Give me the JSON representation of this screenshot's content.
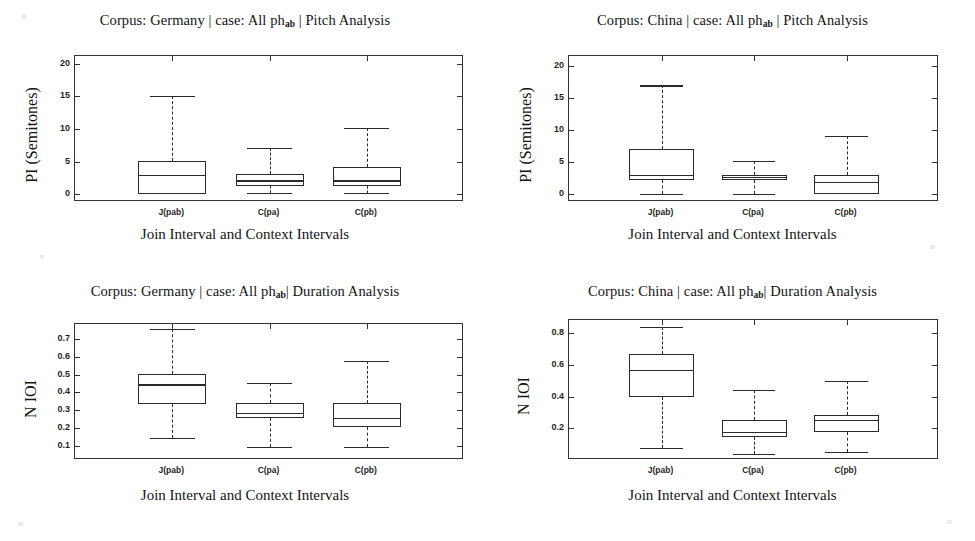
{
  "figure": {
    "background": "#ffffff",
    "line_color": "#2b2b2b",
    "axis_color": "#333333"
  },
  "common": {
    "xlabel": "Join Interval and Context Intervals",
    "categories": [
      "J(pab)",
      "C(pa)",
      "C(pb)"
    ],
    "title_prefix": "Corpus: ",
    "title_case": " | case: All ph",
    "title_sub": "ab"
  },
  "panels": [
    {
      "id": "germany-pitch",
      "title_corpus": "Germany",
      "title_analysis": " | Pitch Analysis",
      "title_full": "Corpus: Germany | case: All phab | Pitch Analysis",
      "ylabel": "PI (Semitones)",
      "xlabel": "Join Interval and Context Intervals",
      "yticks": [
        "0",
        "5",
        "10",
        "15",
        "20"
      ],
      "ytick_values": [
        0,
        5,
        10,
        15,
        20
      ],
      "ylim": [
        -1.2,
        21.2
      ],
      "xtick_labels": [
        "J(pab)",
        "C(pa)",
        "C(pb)"
      ]
    },
    {
      "id": "china-pitch",
      "title_corpus": "China",
      "title_analysis": " | Pitch Analysis",
      "title_full": "Corpus: China | case: All phab | Pitch Analysis",
      "ylabel": "PI (Semitones)",
      "xlabel": "Join Interval and Context Intervals",
      "yticks": [
        "0",
        "5",
        "10",
        "15",
        "20"
      ],
      "ytick_values": [
        0,
        5,
        10,
        15,
        20
      ],
      "ylim": [
        -1.2,
        21.6
      ],
      "xtick_labels": [
        "J(pab)",
        "C(pa)",
        "C(pb)"
      ]
    },
    {
      "id": "germany-duration",
      "title_corpus": "Germany",
      "title_analysis": "| Duration Analysis",
      "title_full": "Corpus: Germany | case: All phab| Duration Analysis",
      "ylabel": "N IOI",
      "xlabel": "Join Interval and Context Intervals",
      "yticks": [
        "0.1",
        "0.2",
        "0.3",
        "0.4",
        "0.5",
        "0.6",
        "0.7"
      ],
      "ytick_values": [
        0.1,
        0.2,
        0.3,
        0.4,
        0.5,
        0.6,
        0.7
      ],
      "ylim": [
        0.02,
        0.785
      ],
      "xtick_labels": [
        "J(pab)",
        "C(pa)",
        "C(pb)"
      ]
    },
    {
      "id": "china-duration",
      "title_corpus": "China",
      "title_analysis": "| Duration Analysis",
      "title_full": "Corpus: China | case: All phab| Duration Analysis",
      "ylabel": "N IOI",
      "xlabel": "Join Interval and Context Intervals",
      "yticks": [
        "0.2",
        "0.4",
        "0.6",
        "0.8"
      ],
      "ytick_values": [
        0.2,
        0.4,
        0.6,
        0.8
      ],
      "ylim": [
        0.0,
        0.885
      ],
      "xtick_labels": [
        "J(pab)",
        "C(pa)",
        "C(pb)"
      ]
    }
  ],
  "chart_data": [
    {
      "type": "box",
      "panel": "germany-pitch",
      "title": "Corpus: Germany | case: All ph_ab | Pitch Analysis",
      "xlabel": "Join Interval and Context Intervals",
      "ylabel": "PI (Semitones)",
      "ylim": [
        -1.2,
        21.2
      ],
      "yticks": [
        0,
        5,
        10,
        15,
        20
      ],
      "grid": false,
      "legend": "none",
      "categories": [
        "J(pab)",
        "C(pa)",
        "C(pb)"
      ],
      "boxes": [
        {
          "label": "J(pab)",
          "whisker_low": 0.0,
          "q1": 0.0,
          "median": 3.0,
          "q3": 5.1,
          "whisker_high": 15.1
        },
        {
          "label": "C(pa)",
          "whisker_low": 0.15,
          "q1": 1.3,
          "median": 2.1,
          "q3": 3.1,
          "whisker_high": 7.15
        },
        {
          "label": "C(pb)",
          "whisker_low": 0.2,
          "q1": 1.3,
          "median": 2.1,
          "q3": 4.1,
          "whisker_high": 10.2
        }
      ]
    },
    {
      "type": "box",
      "panel": "china-pitch",
      "title": "Corpus: China | case: All ph_ab | Pitch Analysis",
      "xlabel": "Join Interval and Context Intervals",
      "ylabel": "PI (Semitones)",
      "ylim": [
        -1.2,
        21.6
      ],
      "yticks": [
        0,
        5,
        10,
        15,
        20
      ],
      "grid": false,
      "legend": "none",
      "categories": [
        "J(pab)",
        "C(pa)",
        "C(pb)"
      ],
      "boxes": [
        {
          "label": "J(pab)",
          "whisker_low": 0.0,
          "q1": 2.2,
          "median": 3.0,
          "q3": 7.0,
          "whisker_high": 17.0
        },
        {
          "label": "C(pa)",
          "whisker_low": 0.0,
          "q1": 2.2,
          "median": 2.7,
          "q3": 3.0,
          "whisker_high": 5.15
        },
        {
          "label": "C(pb)",
          "whisker_low": 0.0,
          "q1": 0.0,
          "median": 2.0,
          "q3": 3.0,
          "whisker_high": 9.15
        }
      ]
    },
    {
      "type": "box",
      "panel": "germany-duration",
      "title": "Corpus: Germany | case: All ph_ab | Duration Analysis",
      "xlabel": "Join Interval and Context Intervals",
      "ylabel": "N IOI",
      "ylim": [
        0.02,
        0.785
      ],
      "yticks": [
        0.1,
        0.2,
        0.3,
        0.4,
        0.5,
        0.6,
        0.7
      ],
      "grid": false,
      "legend": "none",
      "categories": [
        "J(pab)",
        "C(pa)",
        "C(pb)"
      ],
      "boxes": [
        {
          "label": "J(pab)",
          "whisker_low": 0.145,
          "q1": 0.335,
          "median": 0.445,
          "q3": 0.505,
          "whisker_high": 0.755
        },
        {
          "label": "C(pa)",
          "whisker_low": 0.095,
          "q1": 0.255,
          "median": 0.285,
          "q3": 0.34,
          "whisker_high": 0.455
        },
        {
          "label": "C(pb)",
          "whisker_low": 0.095,
          "q1": 0.205,
          "median": 0.255,
          "q3": 0.34,
          "whisker_high": 0.575
        }
      ]
    },
    {
      "type": "box",
      "panel": "china-duration",
      "title": "Corpus: China | case: All ph_ab | Duration Analysis",
      "xlabel": "Join Interval and Context Intervals",
      "ylabel": "N IOI",
      "ylim": [
        0.0,
        0.885
      ],
      "yticks": [
        0.2,
        0.4,
        0.6,
        0.8
      ],
      "grid": false,
      "legend": "none",
      "categories": [
        "J(pab)",
        "C(pa)",
        "C(pb)"
      ],
      "boxes": [
        {
          "label": "J(pab)",
          "whisker_low": 0.075,
          "q1": 0.4,
          "median": 0.57,
          "q3": 0.67,
          "whisker_high": 0.84
        },
        {
          "label": "C(pa)",
          "whisker_low": 0.04,
          "q1": 0.145,
          "median": 0.175,
          "q3": 0.25,
          "whisker_high": 0.44
        },
        {
          "label": "C(pb)",
          "whisker_low": 0.05,
          "q1": 0.175,
          "median": 0.255,
          "q3": 0.285,
          "whisker_high": 0.5
        }
      ]
    }
  ]
}
